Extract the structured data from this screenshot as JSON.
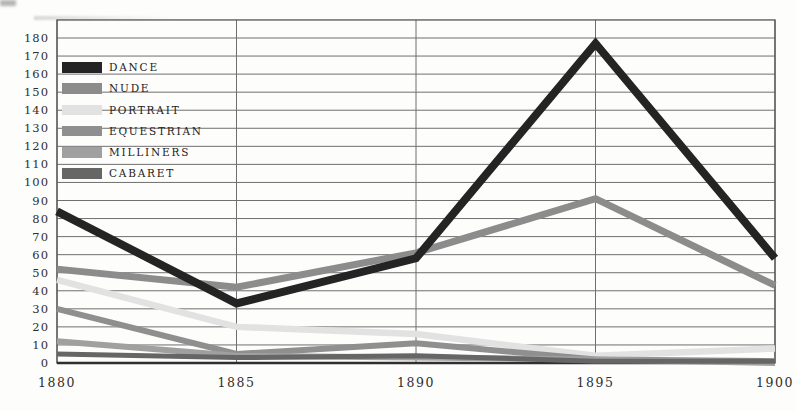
{
  "chart_data": {
    "type": "line",
    "title": "",
    "xlabel": "",
    "ylabel": "",
    "grid": true,
    "legend_position": "top-left",
    "categories": [
      "1880",
      "1885",
      "1890",
      "1895",
      "1900"
    ],
    "y_axis": {
      "min": 0,
      "max": 180,
      "step": 10,
      "frame_top_value": 190
    },
    "series": [
      {
        "name": "DANCE",
        "color": "#242424",
        "stroke_width": 8,
        "values": [
          84,
          33,
          58,
          177,
          58
        ]
      },
      {
        "name": "NUDE",
        "color": "#8c8c8c",
        "stroke_width": 7,
        "values": [
          52,
          42,
          61,
          91,
          43
        ]
      },
      {
        "name": "PORTRAIT",
        "color": "#e2e2e2",
        "stroke_width": 6.5,
        "values": [
          46,
          20,
          16,
          4,
          8
        ]
      },
      {
        "name": "EQUESTRIAN",
        "color": "#8f8f8f",
        "stroke_width": 6,
        "values": [
          30,
          5,
          11,
          2,
          1
        ]
      },
      {
        "name": "MILLINERS",
        "color": "#a0a0a0",
        "stroke_width": 6,
        "values": [
          12,
          4,
          3,
          2,
          0
        ]
      },
      {
        "name": "CABARET",
        "color": "#666666",
        "stroke_width": 5,
        "values": [
          5,
          3,
          4,
          1,
          1
        ]
      }
    ]
  },
  "colors": {
    "background": "#fdfdfc",
    "gridline": "#6f6f6f",
    "frame": "#555555",
    "axis_line": "#2f2f2f",
    "tick_text": "#2e2e2e"
  }
}
